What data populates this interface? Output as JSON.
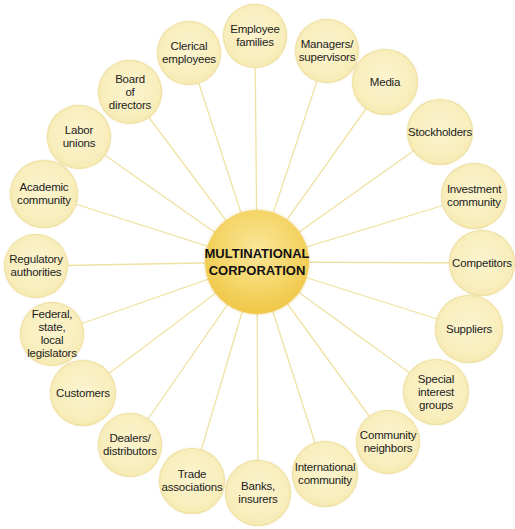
{
  "diagram": {
    "colors": {
      "hub_fill": "#f2cc55",
      "node_fill": "#f8edbb",
      "spoke": "#efe2a2"
    },
    "hub": {
      "label": "MULTINATIONAL\nCORPORATION",
      "cx": 257,
      "cy": 262,
      "r": 52
    },
    "nodes": [
      {
        "label": "Employee\nfamilies",
        "cx": 255,
        "cy": 36,
        "r": 32
      },
      {
        "label": "Managers/\nsupervisors",
        "cx": 327,
        "cy": 51,
        "r": 32
      },
      {
        "label": "Media",
        "cx": 385,
        "cy": 82,
        "r": 33
      },
      {
        "label": "Stockholders",
        "cx": 440,
        "cy": 132,
        "r": 33
      },
      {
        "label": "Investment\ncommunity",
        "cx": 474,
        "cy": 196,
        "r": 33
      },
      {
        "label": "Competitors",
        "cx": 482,
        "cy": 263,
        "r": 33
      },
      {
        "label": "Suppliers",
        "cx": 469,
        "cy": 329,
        "r": 34
      },
      {
        "label": "Special\ninterest\ngroups",
        "cx": 436,
        "cy": 392,
        "r": 33
      },
      {
        "label": "Community\nneighbors",
        "cx": 388,
        "cy": 442,
        "r": 32
      },
      {
        "label": "International\ncommunity",
        "cx": 325,
        "cy": 474,
        "r": 33
      },
      {
        "label": "Banks,\ninsurers",
        "cx": 258,
        "cy": 493,
        "r": 33
      },
      {
        "label": "Trade\nassociations",
        "cx": 192,
        "cy": 481,
        "r": 33
      },
      {
        "label": "Dealers/\ndistributors",
        "cx": 130,
        "cy": 445,
        "r": 32
      },
      {
        "label": "Customers",
        "cx": 83,
        "cy": 393,
        "r": 33
      },
      {
        "label": "Federal,\nstate,\nlocal\nlegislators",
        "cx": 52,
        "cy": 334,
        "r": 32
      },
      {
        "label": "Regulatory\nauthorities",
        "cx": 36,
        "cy": 266,
        "r": 32
      },
      {
        "label": "Academic\ncommunity",
        "cx": 44,
        "cy": 194,
        "r": 34
      },
      {
        "label": "Labor\nunions",
        "cx": 79,
        "cy": 137,
        "r": 32
      },
      {
        "label": "Board\nof\ndirectors",
        "cx": 130,
        "cy": 92,
        "r": 32
      },
      {
        "label": "Clerical\nemployees",
        "cx": 189,
        "cy": 53,
        "r": 32
      }
    ]
  }
}
